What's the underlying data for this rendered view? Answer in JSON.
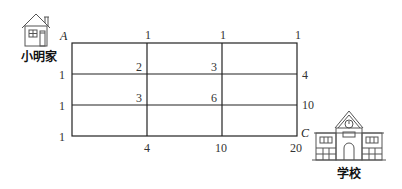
{
  "labels": {
    "home": "小明家",
    "school": "学校",
    "point_a": "A",
    "point_c": "C"
  },
  "grid": {
    "cols": 3,
    "rows": 3,
    "top_labels": [
      "1",
      "1",
      "1"
    ],
    "left_labels": [
      "1",
      "1",
      "1"
    ],
    "right_labels": [
      "4",
      "10"
    ],
    "bottom_labels": [
      "4",
      "10",
      "20"
    ],
    "inner_labels": [
      {
        "row": 1,
        "col": 1,
        "value": "2"
      },
      {
        "row": 1,
        "col": 2,
        "value": "3"
      },
      {
        "row": 2,
        "col": 1,
        "value": "3"
      },
      {
        "row": 2,
        "col": 2,
        "value": "6"
      }
    ]
  },
  "icons": {
    "home": "house-icon",
    "school": "school-building-icon"
  }
}
